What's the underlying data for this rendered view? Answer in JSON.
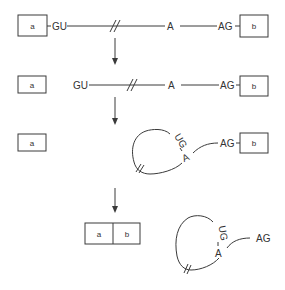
{
  "diagram": {
    "type": "RNA splicing mechanism (lariat formation)",
    "colors": {
      "line": "#3a3a3a",
      "text": "#333333",
      "background": "#ffffff"
    },
    "labels": {
      "exon1": "a",
      "exon2": "b",
      "donor_site": "GU",
      "branch_point": "A",
      "acceptor_site": "AG",
      "lariat_donor": "UG"
    },
    "steps": [
      {
        "id": "precursor",
        "description": "Pre-mRNA: exon a – GU … A … AG – exon b"
      },
      {
        "id": "cleavage_5prime",
        "description": "5' splice site cleaved: exon a released, GU … A … AG – exon b"
      },
      {
        "id": "lariat_intermediate",
        "description": "Lariat formed via UG–A linkage, AG – exon b still attached"
      },
      {
        "id": "products",
        "description": "Ligated exons a|b and excised lariat intron ending in AG"
      }
    ],
    "arrows": 3
  }
}
